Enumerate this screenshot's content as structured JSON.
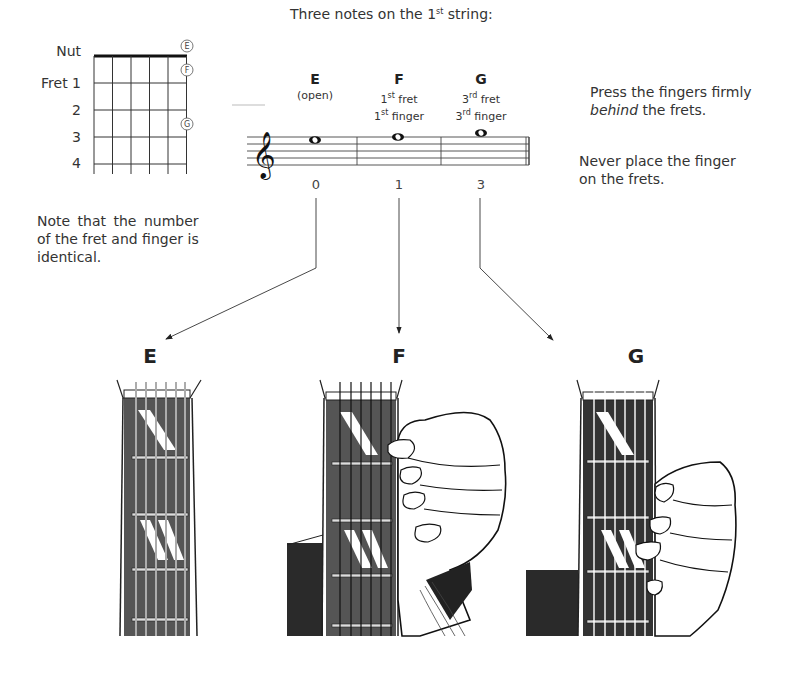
{
  "fret_diagram": {
    "labels": [
      "Nut",
      "Fret 1",
      "2",
      "3",
      "4"
    ],
    "circled_notes": [
      {
        "note": "E",
        "position": "open"
      },
      {
        "note": "F",
        "position": "fret 1"
      },
      {
        "note": "G",
        "position": "fret 3"
      }
    ]
  },
  "staff": {
    "title_prefix": "Three notes on the 1",
    "title_sup": "st",
    "title_suffix": " string:",
    "notes": [
      {
        "name": "E",
        "line1": "(open)",
        "line2": "",
        "tab": "0"
      },
      {
        "name": "F",
        "line1_num": "1",
        "line1_sup": "st",
        "line1_text": " fret",
        "line2_num": "1",
        "line2_sup": "st",
        "line2_text": " finger",
        "tab": "1"
      },
      {
        "name": "G",
        "line1_num": "3",
        "line1_sup": "rd",
        "line1_text": " fret",
        "line2_num": "3",
        "line2_sup": "rd",
        "line2_text": " finger",
        "tab": "3"
      }
    ]
  },
  "notes_text": {
    "press_a": "Press the fingers firmly",
    "press_b_em": "behind",
    "press_b_rest": " the frets.",
    "never_a": "Never place the finger",
    "never_b": "on the frets.",
    "identical_a": "Note that the number",
    "identical_b": "of the fret and finger is",
    "identical_c": "identical."
  },
  "illustrations": [
    {
      "label": "E",
      "description": "open string, no finger"
    },
    {
      "label": "F",
      "description": "1st finger behind 1st fret"
    },
    {
      "label": "G",
      "description": "3rd finger behind 3rd fret"
    }
  ],
  "colors": {
    "ink": "#222222",
    "text": "#333333",
    "background": "#ffffff"
  }
}
